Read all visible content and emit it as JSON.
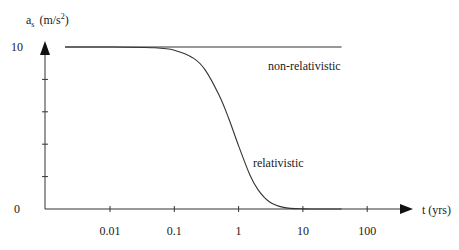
{
  "chart_data": {
    "type": "line",
    "title": "",
    "xlabel": "t (yrs)",
    "ylabel": "a",
    "ylabel_subscript": "s",
    "ylabel_unit": "(m/s",
    "ylabel_unit_sup": "2",
    "ylabel_unit_close": ")",
    "xscale": "log",
    "xlim": [
      0.0005,
      500
    ],
    "ylim": [
      0,
      10
    ],
    "x_ticks": [
      {
        "value": 0.01,
        "label": "0.01"
      },
      {
        "value": 0.1,
        "label": "0.1"
      },
      {
        "value": 1,
        "label": "1"
      },
      {
        "value": 10,
        "label": "10"
      },
      {
        "value": 100,
        "label": "100"
      }
    ],
    "y_ticks": [
      {
        "value": 0,
        "label": "0"
      },
      {
        "value": 2,
        "label": ""
      },
      {
        "value": 4,
        "label": ""
      },
      {
        "value": 6,
        "label": ""
      },
      {
        "value": 8,
        "label": ""
      },
      {
        "value": 10,
        "label": "10"
      }
    ],
    "grid": false,
    "legend": "none",
    "series": [
      {
        "name": "non-relativistic",
        "x": [
          0.002,
          0.01,
          0.1,
          1,
          10,
          40
        ],
        "y": [
          10,
          10,
          10,
          10,
          10,
          10
        ]
      },
      {
        "name": "relativistic",
        "x": [
          0.002,
          0.01,
          0.05,
          0.1,
          0.2,
          0.3,
          0.5,
          0.7,
          1,
          1.5,
          2,
          3,
          5,
          10,
          40
        ],
        "y": [
          10,
          10,
          9.95,
          9.8,
          9.3,
          8.6,
          7.0,
          5.6,
          3.9,
          2.1,
          1.2,
          0.45,
          0.1,
          0.01,
          0
        ]
      }
    ],
    "annotations": [
      {
        "text": "non-relativistic",
        "x": 12,
        "y": 8.6
      },
      {
        "text": "relativistic",
        "x": 7,
        "y": 2.6
      }
    ],
    "ylabel_text": "a_s (m/s^2)"
  }
}
